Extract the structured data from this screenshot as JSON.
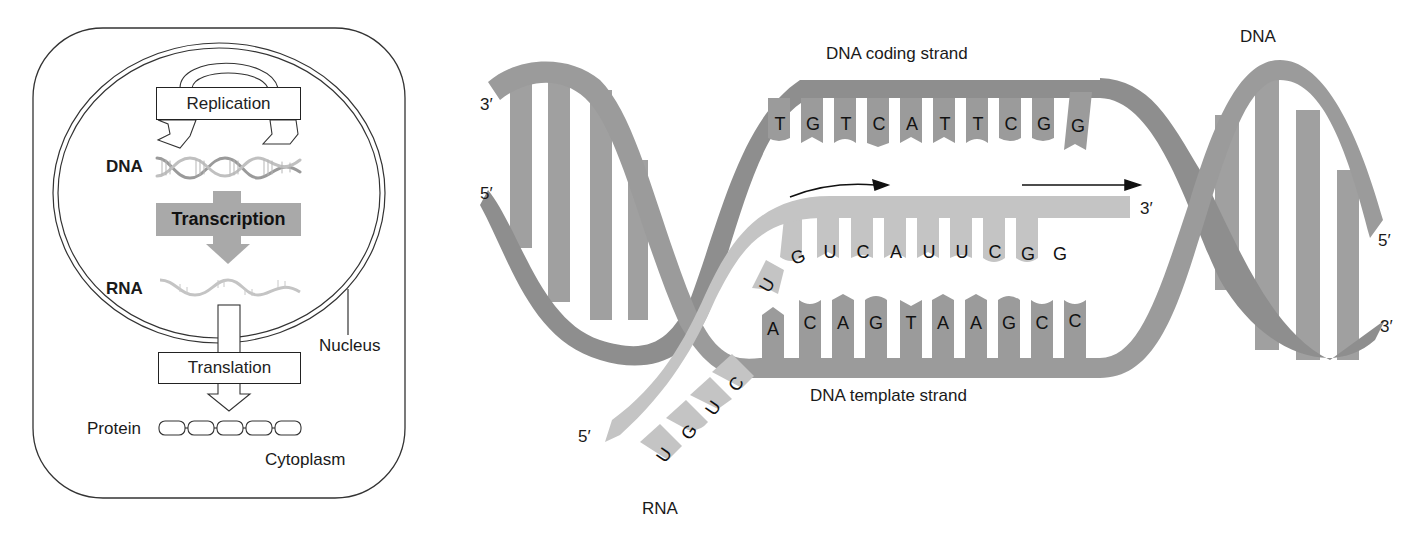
{
  "overview_panel": {
    "replication_label": "Replication",
    "dna_label": "DNA",
    "transcription_label": "Transcription",
    "rna_label": "RNA",
    "translation_label": "Translation",
    "protein_label": "Protein",
    "nucleus_label": "Nucleus",
    "cytoplasm_label": "Cytoplasm",
    "protein_beads": 5
  },
  "detail_panel": {
    "coding_strand_label": "DNA coding strand",
    "template_strand_label": "DNA template strand",
    "dna_label": "DNA",
    "rna_label": "RNA",
    "ends": {
      "left_top": "3′",
      "left_bottom": "5′",
      "rna_3prime": "3′",
      "rna_5prime": "5′",
      "right_top": "5′",
      "right_bottom": "3′"
    },
    "coding_strand_bases": [
      "T",
      "G",
      "T",
      "C",
      "A",
      "T",
      "T",
      "C",
      "G",
      "G"
    ],
    "template_strand_bases": [
      "A",
      "C",
      "A",
      "G",
      "T",
      "A",
      "A",
      "G",
      "C",
      "C"
    ],
    "rna_paired_bases": [
      "U",
      "G",
      "U",
      "C",
      "A",
      "U",
      "U",
      "C",
      "G",
      "G"
    ],
    "rna_tail_bases": [
      "U",
      "G",
      "U",
      "C"
    ]
  },
  "colors": {
    "dna_dark": "#8e8e8e",
    "dna_mid": "#9d9d9d",
    "rna_light": "#c4c4c4",
    "transcription_box": "#a9a9a9",
    "outline": "#222222"
  }
}
